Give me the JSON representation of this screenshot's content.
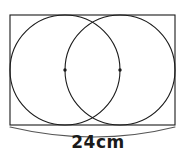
{
  "figure": {
    "canvas": {
      "width": 196,
      "height": 160,
      "background": "#ffffff"
    },
    "stroke_color": "#1a1a1a",
    "stroke_width": 1.1,
    "fill": "none",
    "rectangle": {
      "name": "bounding-rectangle",
      "x": 10,
      "y": 15,
      "width": 165,
      "height": 110,
      "label": "rectangle"
    },
    "circles": [
      {
        "name": "left-circle",
        "cx": 65,
        "cy": 70,
        "r": 55,
        "label": "left circle"
      },
      {
        "name": "right-circle",
        "cx": 120,
        "cy": 70,
        "r": 55,
        "label": "right circle"
      }
    ],
    "center_points": [
      {
        "name": "left-circle-center",
        "cx": 65,
        "cy": 70,
        "r": 1.7
      },
      {
        "name": "right-circle-center",
        "cx": 120,
        "cy": 70,
        "r": 1.7
      }
    ],
    "dimension": {
      "name": "width-dimension",
      "value": "24cm",
      "number": 24,
      "unit": "cm",
      "spans": "full rectangle width",
      "arc_path": "M 10 127 Q 95 147 175 127",
      "arc_start_x": 10,
      "arc_end_x": 175,
      "arc_y": 127,
      "label_x": 95,
      "label_y": 143
    }
  }
}
